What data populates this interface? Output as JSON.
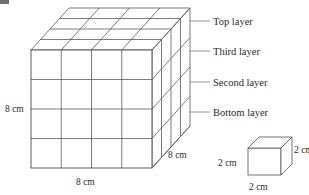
{
  "figure": {
    "big_cube": {
      "name": "large-cube",
      "divisions_per_edge": 4,
      "dimension_labels": {
        "height": "8 cm",
        "width": "8 cm",
        "depth": "8 cm"
      }
    },
    "unit_cube": {
      "name": "unit-cube",
      "dimension_labels": {
        "left": "2 cm",
        "right": "2 cm",
        "bottom": "2 cm"
      }
    },
    "layer_callouts": [
      {
        "id": "top",
        "label": "Top layer"
      },
      {
        "id": "third",
        "label": "Third layer"
      },
      {
        "id": "second",
        "label": "Second layer"
      },
      {
        "id": "bottom",
        "label": "Bottom layer"
      }
    ],
    "colors": {
      "stroke": "#5b5b5d",
      "stroke_dark": "#3a3a3c",
      "leader": "#8a8a8c",
      "text": "#2b2b2b",
      "background": "#ffffff"
    }
  }
}
